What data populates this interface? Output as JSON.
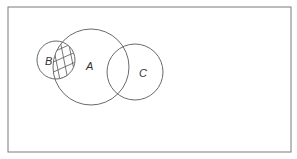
{
  "diagram": {
    "type": "venn",
    "frame": {
      "x": 8,
      "y": 7,
      "width": 283,
      "height": 145,
      "stroke": "#7a7a7a"
    },
    "stroke_color": "#6a6a6a",
    "sets": [
      {
        "id": "A",
        "label": "A",
        "cx": 91,
        "cy": 67,
        "r": 38,
        "label_x": 86,
        "label_y": 70
      },
      {
        "id": "B",
        "label": "B",
        "cx": 56,
        "cy": 60,
        "r": 19,
        "label_x": 45,
        "label_y": 65
      },
      {
        "id": "C",
        "label": "C",
        "cx": 135,
        "cy": 72,
        "r": 28,
        "label_x": 139,
        "label_y": 77
      }
    ],
    "shaded_region": {
      "description": "B ∩ A",
      "pattern": "cross-hatch"
    }
  }
}
